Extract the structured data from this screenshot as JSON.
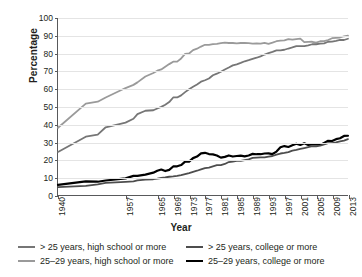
{
  "chart_data": {
    "type": "line",
    "title": "",
    "xlabel": "Year",
    "ylabel": "Percentage",
    "xlim": [
      1940,
      2013
    ],
    "ylim": [
      0,
      100
    ],
    "grid": true,
    "legend_position": "bottom",
    "ytick_labels": [
      "0",
      "10",
      "20",
      "30",
      "40",
      "50",
      "60",
      "70",
      "80",
      "90",
      "100"
    ],
    "ytick_values": [
      0,
      10,
      20,
      30,
      40,
      50,
      60,
      70,
      80,
      90,
      100
    ],
    "xtick_labels": [
      "1940",
      "1957",
      "1965",
      "1969",
      "1973",
      "1977",
      "1981",
      "1985",
      "1989",
      "1993",
      "1997",
      "2001",
      "2005",
      "2009",
      "2013"
    ],
    "xtick_values": [
      1940,
      1957,
      1965,
      1969,
      1973,
      1977,
      1981,
      1985,
      1989,
      1993,
      1997,
      2001,
      2005,
      2009,
      2013
    ],
    "x": [
      1940,
      1947,
      1950,
      1952,
      1957,
      1959,
      1960,
      1962,
      1964,
      1965,
      1966,
      1967,
      1968,
      1969,
      1970,
      1971,
      1972,
      1973,
      1974,
      1975,
      1976,
      1977,
      1978,
      1979,
      1980,
      1981,
      1982,
      1983,
      1984,
      1985,
      1986,
      1987,
      1988,
      1989,
      1990,
      1991,
      1992,
      1993,
      1994,
      1995,
      1996,
      1997,
      1998,
      1999,
      2000,
      2001,
      2002,
      2003,
      2004,
      2005,
      2006,
      2007,
      2008,
      2009,
      2010,
      2011,
      2012,
      2013
    ],
    "series": [
      {
        "name": "25-29 years, high school or more",
        "color": "#9a9a9a",
        "width": 1.8,
        "values": [
          38.1,
          51.7,
          52.8,
          55.2,
          60.5,
          62.3,
          63.7,
          67.0,
          69.0,
          70.3,
          71.0,
          72.5,
          74.0,
          75.4,
          75.4,
          77.2,
          79.8,
          80.0,
          81.9,
          82.7,
          83.9,
          84.9,
          84.9,
          85.3,
          85.4,
          85.8,
          86.1,
          85.9,
          85.9,
          85.7,
          85.9,
          85.9,
          85.8,
          85.6,
          85.7,
          85.5,
          86.0,
          85.4,
          86.1,
          86.9,
          87.3,
          87.4,
          88.1,
          87.8,
          88.1,
          88.4,
          86.4,
          86.5,
          86.6,
          86.1,
          86.9,
          87.0,
          87.6,
          88.6,
          88.8,
          89.0,
          89.7,
          90.1
        ]
      },
      {
        "name": "> 25 years, high school or more",
        "color": "#767676",
        "width": 1.8,
        "values": [
          24.5,
          33.1,
          34.3,
          38.4,
          41.0,
          43.2,
          45.8,
          47.7,
          48.0,
          49.0,
          49.9,
          51.1,
          52.6,
          55.2,
          55.2,
          56.4,
          58.2,
          59.8,
          61.2,
          62.5,
          64.1,
          64.9,
          65.9,
          67.7,
          68.6,
          69.7,
          71.0,
          72.1,
          73.3,
          73.9,
          74.7,
          75.6,
          76.2,
          76.9,
          77.6,
          78.4,
          79.4,
          80.2,
          80.9,
          81.7,
          81.7,
          82.1,
          82.8,
          83.4,
          84.1,
          84.1,
          84.1,
          84.6,
          85.2,
          85.2,
          85.5,
          85.7,
          86.6,
          86.7,
          87.1,
          87.6,
          87.6,
          88.3
        ]
      },
      {
        "name": "25-29 years, college or more",
        "color": "#000000",
        "width": 2.2,
        "values": [
          5.9,
          7.9,
          7.7,
          8.4,
          9.6,
          11.0,
          11.0,
          11.7,
          12.8,
          13.9,
          14.6,
          13.7,
          14.4,
          16.3,
          16.4,
          17.1,
          19.0,
          19.0,
          21.0,
          21.9,
          23.7,
          24.0,
          23.3,
          23.1,
          22.5,
          21.3,
          21.7,
          22.5,
          21.9,
          22.2,
          22.4,
          22.0,
          22.5,
          23.4,
          23.2,
          23.2,
          23.6,
          23.7,
          23.3,
          24.7,
          27.1,
          27.8,
          27.3,
          28.2,
          29.1,
          28.4,
          29.4,
          28.4,
          28.7,
          28.8,
          28.4,
          29.6,
          30.8,
          30.6,
          31.7,
          32.2,
          33.5,
          33.6
        ]
      },
      {
        "name": "> 25 years, college or more",
        "color": "#4d4d4d",
        "width": 1.8,
        "values": [
          4.6,
          5.4,
          6.2,
          7.0,
          7.6,
          7.9,
          8.4,
          8.9,
          9.1,
          9.4,
          9.8,
          10.1,
          10.5,
          10.7,
          11.0,
          11.4,
          12.0,
          12.6,
          13.3,
          13.9,
          14.7,
          15.4,
          15.7,
          16.4,
          17.0,
          17.1,
          17.7,
          18.8,
          19.1,
          19.4,
          19.4,
          19.9,
          20.3,
          21.1,
          21.3,
          21.4,
          21.4,
          21.9,
          22.2,
          23.0,
          23.6,
          23.9,
          24.4,
          25.2,
          25.6,
          26.2,
          26.7,
          27.2,
          27.7,
          27.7,
          28.0,
          28.7,
          29.4,
          29.5,
          29.9,
          30.4,
          30.9,
          31.7
        ]
      }
    ]
  },
  "legend": {
    "items": [
      {
        "label": "> 25 years, high school or more",
        "color": "#767676",
        "thickness": "2px"
      },
      {
        "label": "> 25 years, college or more",
        "color": "#4d4d4d",
        "thickness": "2px"
      },
      {
        "label": "25–29 years, high school or more",
        "color": "#9a9a9a",
        "thickness": "2px"
      },
      {
        "label": "25–29 years, college or more",
        "color": "#000000",
        "thickness": "2.6px"
      }
    ]
  }
}
